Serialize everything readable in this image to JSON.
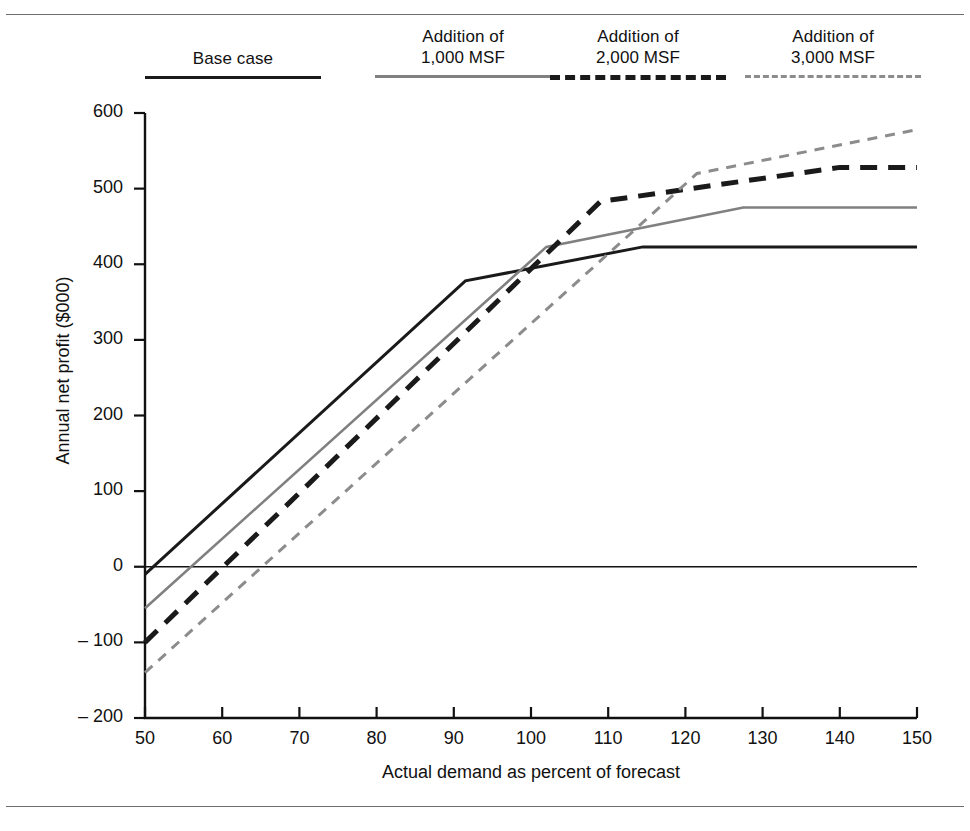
{
  "figure": {
    "has_top_rule": true,
    "has_bottom_rule": true
  },
  "legend": {
    "items": [
      {
        "label": "Base case",
        "style": "solid",
        "color": "#1a1a1a",
        "name": "base-case"
      },
      {
        "label": "Addition of\n1,000 MSF",
        "style": "solid",
        "color": "#808080",
        "name": "addition-1000-msf"
      },
      {
        "label": "Addition of\n2,000 MSF",
        "style": "dashed",
        "color": "#1a1a1a",
        "name": "addition-2000-msf"
      },
      {
        "label": "Addition of\n3,000 MSF",
        "style": "dashed",
        "color": "#8c8c8c",
        "name": "addition-3000-msf"
      }
    ]
  },
  "axes": {
    "xlabel": "Actual demand as percent of forecast",
    "ylabel": "Annual net profit ($000)",
    "xticks": [
      "50",
      "60",
      "70",
      "80",
      "90",
      "100",
      "110",
      "120",
      "130",
      "140",
      "150"
    ],
    "yticks": [
      "600",
      "500",
      "400",
      "300",
      "200",
      "100",
      "0",
      "– 100",
      "– 200"
    ]
  },
  "chart_data": {
    "type": "line",
    "title": "",
    "xlabel": "Actual demand as percent of forecast",
    "ylabel": "Annual net profit ($000)",
    "xlim": [
      50,
      150
    ],
    "ylim": [
      -200,
      600
    ],
    "xticks": [
      50,
      60,
      70,
      80,
      90,
      100,
      110,
      120,
      130,
      140,
      150
    ],
    "yticks": [
      -200,
      -100,
      0,
      100,
      200,
      300,
      400,
      500,
      600
    ],
    "grid": false,
    "legend_position": "top",
    "zero_line": 0,
    "series": [
      {
        "name": "Base case",
        "color": "#1a1a1a",
        "style": "solid",
        "width": 3,
        "x": [
          50,
          91.5,
          114.5,
          150
        ],
        "y": [
          -10,
          378,
          423,
          423
        ]
      },
      {
        "name": "Addition of 1,000 MSF",
        "color": "#808080",
        "style": "solid",
        "width": 2.6,
        "x": [
          50,
          102,
          127.5,
          150
        ],
        "y": [
          -55,
          423,
          475,
          475
        ]
      },
      {
        "name": "Addition of 2,000 MSF",
        "color": "#1a1a1a",
        "style": "dashed",
        "width": 5,
        "x": [
          50,
          109,
          140,
          150
        ],
        "y": [
          -100,
          483,
          528,
          528
        ]
      },
      {
        "name": "Addition of 3,000 MSF",
        "color": "#8c8c8c",
        "style": "dashed",
        "width": 3,
        "x": [
          50,
          121.5,
          150
        ],
        "y": [
          -140,
          520,
          578
        ]
      }
    ]
  }
}
